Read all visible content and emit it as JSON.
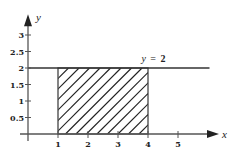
{
  "chart_data": {
    "type": "area",
    "title": "",
    "xlabel": "x",
    "ylabel": "y",
    "xlim": [
      -0.3,
      6.3
    ],
    "ylim": [
      -0.2,
      3.6
    ],
    "x_ticks": [
      1,
      2,
      3,
      4,
      5
    ],
    "x_tick_labels": [
      "1",
      "2",
      "3",
      "4",
      "5"
    ],
    "y_ticks": [
      0.5,
      1,
      1.5,
      2,
      2.5,
      3
    ],
    "y_tick_labels": [
      "0.5",
      "1",
      "1.5",
      "2",
      "2.5",
      "3"
    ],
    "grid": false,
    "reference_line": {
      "equation": "y = 2",
      "y": 2,
      "x_from": 0,
      "x_to": 6.05,
      "label_var": "y",
      "label_eq": "=",
      "label_val": "2"
    },
    "shaded_region": {
      "x_from": 1,
      "x_to": 4,
      "y_from": 0,
      "y_to": 2,
      "fill": "diagonal-hatch"
    }
  }
}
